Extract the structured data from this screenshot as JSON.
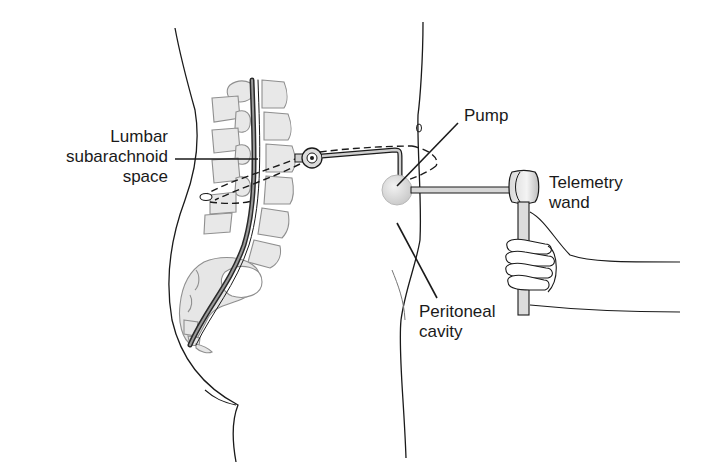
{
  "figure": {
    "colors": {
      "outline": "#1a1a1a",
      "bone_fill": "#e6e6e6",
      "bone_stroke": "#8a8a8a",
      "pump_fill": "#dcdcdc",
      "background": "#ffffff"
    },
    "labels": {
      "lumbar": {
        "line1": "Lumbar",
        "line2": "subarachnoid",
        "line3": "space"
      },
      "pump": {
        "line1": "Pump"
      },
      "telemetry": {
        "line1": "Telemetry",
        "line2": "wand"
      },
      "peritoneal": {
        "line1": "Peritoneal",
        "line2": "cavity"
      }
    }
  }
}
